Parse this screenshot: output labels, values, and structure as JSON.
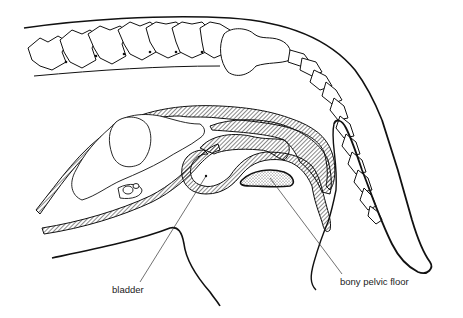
{
  "diagram": {
    "labels": [
      {
        "id": "bladder",
        "text": "bladder"
      },
      {
        "id": "pelvic-floor",
        "text": "bony pelvic floor"
      }
    ],
    "colors": {
      "line": "#111111",
      "leader": "#333333",
      "background": "#ffffff"
    }
  }
}
